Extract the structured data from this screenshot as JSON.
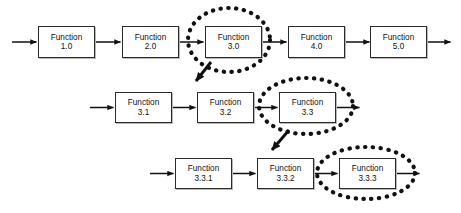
{
  "diagram": {
    "type": "functional-flow-block-diagram",
    "colors": {
      "background": "#ffffff",
      "box_fill": "#ffffff",
      "box_border": "#2b2b2b",
      "box_shadow": "#b8b8b8",
      "connector": "#111111",
      "highlight_ellipse": "#111111",
      "text": "#111111"
    },
    "levels": [
      {
        "id": "level-1",
        "index": 0,
        "has_input_arrow": true,
        "has_output_arrow": true,
        "nodes": [
          {
            "id": "fn-1-0",
            "name": "Function",
            "number": "1.0",
            "highlighted": false
          },
          {
            "id": "fn-2-0",
            "name": "Function",
            "number": "2.0",
            "highlighted": false
          },
          {
            "id": "fn-3-0",
            "name": "Function",
            "number": "3.0",
            "highlighted": true
          },
          {
            "id": "fn-4-0",
            "name": "Function",
            "number": "4.0",
            "highlighted": false
          },
          {
            "id": "fn-5-0",
            "name": "Function",
            "number": "5.0",
            "highlighted": false
          }
        ]
      },
      {
        "id": "level-2",
        "index": 1,
        "has_input_arrow": true,
        "has_output_arrow": true,
        "nodes": [
          {
            "id": "fn-3-1",
            "name": "Function",
            "number": "3.1",
            "highlighted": false
          },
          {
            "id": "fn-3-2",
            "name": "Function",
            "number": "3.2",
            "highlighted": false
          },
          {
            "id": "fn-3-3",
            "name": "Function",
            "number": "3.3",
            "highlighted": true
          }
        ]
      },
      {
        "id": "level-3",
        "index": 2,
        "has_input_arrow": true,
        "has_output_arrow": true,
        "nodes": [
          {
            "id": "fn-3-3-1",
            "name": "Function",
            "number": "3.3.1",
            "highlighted": false
          },
          {
            "id": "fn-3-3-2",
            "name": "Function",
            "number": "3.3.2",
            "highlighted": false
          },
          {
            "id": "fn-3-3-3",
            "name": "Function",
            "number": "3.3.3",
            "highlighted": true
          }
        ]
      }
    ],
    "decomposition_links": [
      {
        "id": "link-3-0-to-level-2",
        "from": "fn-3-0",
        "to": "level-2",
        "style": "dashed-diagonal-arrow"
      },
      {
        "id": "link-3-3-to-level-3",
        "from": "fn-3-3",
        "to": "level-3",
        "style": "dashed-diagonal-arrow"
      }
    ]
  }
}
